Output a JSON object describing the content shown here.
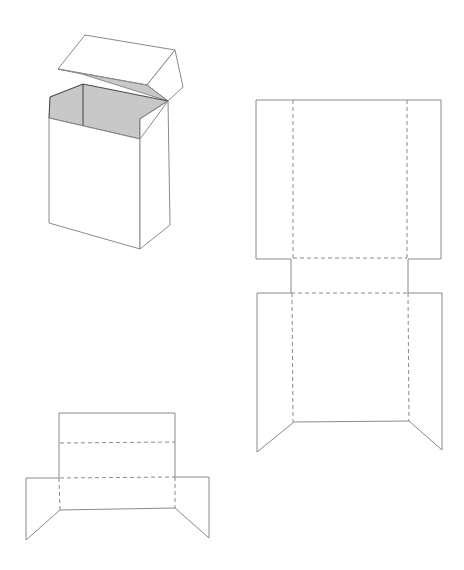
{
  "figure": {
    "colors": {
      "line": "#8a8a8a",
      "dark_line": "#4a4a4a",
      "interior_fill": "#c8c8c8",
      "background": "#ffffff"
    },
    "components": [
      {
        "id": "assembled-box",
        "label": "Assembled flip-top box with open lid"
      },
      {
        "id": "large-template",
        "label": "Large flat box template with fold lines"
      },
      {
        "id": "small-template",
        "label": "Small flat lid template with fold lines"
      }
    ]
  }
}
